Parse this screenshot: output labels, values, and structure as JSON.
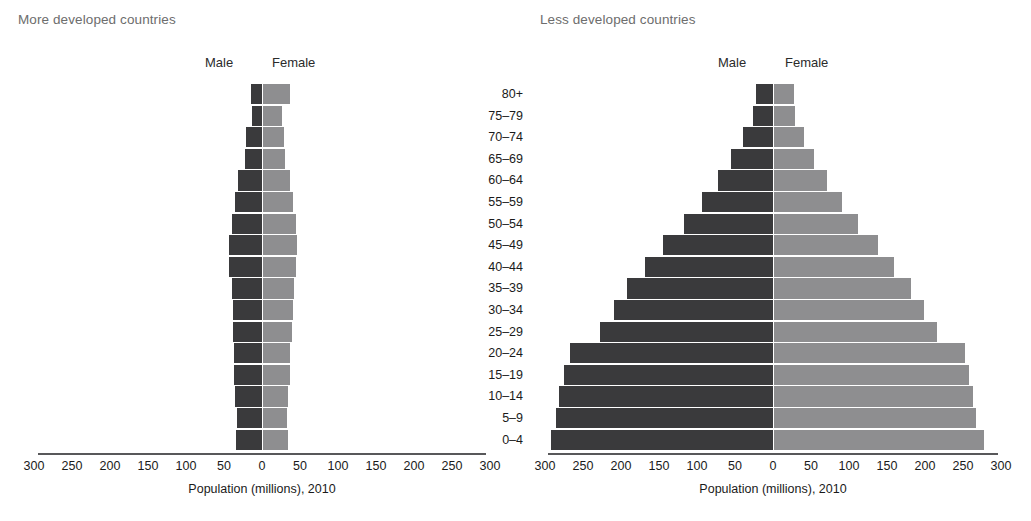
{
  "panels": {
    "left": {
      "title": "More developed countries",
      "male_header": "Male",
      "female_header": "Female",
      "axis_title": "Population (millions), 2010"
    },
    "right": {
      "title": "Less developed countries",
      "male_header": "Male",
      "female_header": "Female",
      "axis_title": "Population (millions), 2010"
    }
  },
  "axis": {
    "tick_labels": [
      "300",
      "250",
      "200",
      "150",
      "100",
      "50",
      "0",
      "50",
      "100",
      "150",
      "200",
      "250",
      "300"
    ],
    "tick_values": [
      -300,
      -250,
      -200,
      -150,
      -100,
      -50,
      0,
      50,
      100,
      150,
      200,
      250,
      300
    ],
    "min": -300,
    "max": 300
  },
  "age_groups": [
    "80+",
    "75–79",
    "70–74",
    "65–69",
    "60–64",
    "55–59",
    "50–54",
    "45–49",
    "40–44",
    "35–39",
    "30–34",
    "25–29",
    "20–24",
    "15–19",
    "10–14",
    "5–9",
    "0–4"
  ],
  "colors": {
    "male": "#3a3a3c",
    "female": "#8e8e90",
    "axis": "#58585a",
    "title_text": "#6d6d6d",
    "background": "#ffffff"
  },
  "chart_data": [
    {
      "type": "bar",
      "id": "more-developed-countries",
      "title": "More developed countries",
      "subtitle": "",
      "orientation": "horizontal-diverging",
      "xlabel": "Population (millions), 2010",
      "ylabel": "",
      "xlim": [
        -300,
        300
      ],
      "xticks": [
        -300,
        -250,
        -200,
        -150,
        -100,
        -50,
        0,
        50,
        100,
        150,
        200,
        250,
        300
      ],
      "xticklabels": [
        "300",
        "250",
        "200",
        "150",
        "100",
        "50",
        "0",
        "50",
        "100",
        "150",
        "200",
        "250",
        "300"
      ],
      "grid": false,
      "legend": "top-inline",
      "categories": [
        "80+",
        "75–79",
        "70–74",
        "65–69",
        "60–64",
        "55–59",
        "50–54",
        "45–49",
        "40–44",
        "35–39",
        "30–34",
        "25–29",
        "20–24",
        "15–19",
        "10–14",
        "5–9",
        "0–4"
      ],
      "series": [
        {
          "name": "Male",
          "values": [
            14,
            13,
            21,
            23,
            31,
            36,
            40,
            43,
            43,
            40,
            38,
            38,
            37,
            37,
            35,
            33,
            34
          ]
        },
        {
          "name": "Female",
          "values": [
            36,
            25,
            28,
            29,
            36,
            39,
            43,
            45,
            44,
            41,
            39,
            38,
            36,
            35,
            33,
            32,
            33
          ]
        }
      ]
    },
    {
      "type": "bar",
      "id": "less-developed-countries",
      "title": "Less developed countries",
      "subtitle": "",
      "orientation": "horizontal-diverging",
      "xlabel": "Population (millions), 2010",
      "ylabel": "",
      "xlim": [
        -300,
        300
      ],
      "xticks": [
        -300,
        -250,
        -200,
        -150,
        -100,
        -50,
        0,
        50,
        100,
        150,
        200,
        250,
        300
      ],
      "xticklabels": [
        "300",
        "250",
        "200",
        "150",
        "100",
        "50",
        "0",
        "50",
        "100",
        "150",
        "200",
        "250",
        "300"
      ],
      "grid": false,
      "legend": "top-inline",
      "categories": [
        "80+",
        "75–79",
        "70–74",
        "65–69",
        "60–64",
        "55–59",
        "50–54",
        "45–49",
        "40–44",
        "35–39",
        "30–34",
        "25–29",
        "20–24",
        "15–19",
        "10–14",
        "5–9",
        "0–4"
      ],
      "series": [
        {
          "name": "Male",
          "values": [
            22,
            26,
            40,
            55,
            72,
            94,
            117,
            145,
            168,
            192,
            209,
            228,
            267,
            275,
            282,
            285,
            292
          ]
        },
        {
          "name": "Female",
          "values": [
            26,
            28,
            40,
            53,
            70,
            90,
            111,
            137,
            158,
            180,
            197,
            215,
            251,
            257,
            262,
            266,
            276
          ]
        }
      ]
    }
  ]
}
